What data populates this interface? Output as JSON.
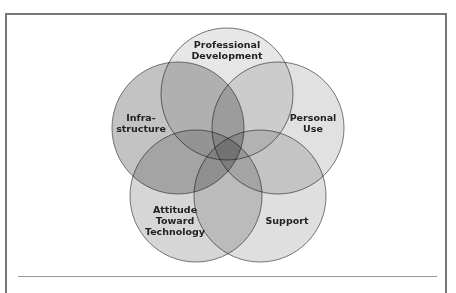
{
  "diagram": {
    "type": "venn",
    "sets": [
      {
        "id": "professional-development",
        "label_lines": [
          "Professional",
          "Development"
        ],
        "fill": "#d9d9d9",
        "cx": 227,
        "cy": 94,
        "r": 66,
        "label_x": 227,
        "label_y": 48
      },
      {
        "id": "personal-use",
        "label_lines": [
          "Personal",
          "Use"
        ],
        "fill": "#cfcfcf",
        "cx": 278,
        "cy": 128,
        "r": 66,
        "label_x": 313,
        "label_y": 121
      },
      {
        "id": "support",
        "label_lines": [
          "Support"
        ],
        "fill": "#cccccc",
        "cx": 260,
        "cy": 196,
        "r": 66,
        "label_x": 287,
        "label_y": 224
      },
      {
        "id": "attitude-toward-technology",
        "label_lines": [
          "Attitude",
          "Toward",
          "Technology"
        ],
        "fill": "#bdbdbd",
        "cx": 196,
        "cy": 196,
        "r": 66,
        "label_x": 175,
        "label_y": 213
      },
      {
        "id": "infrastructure",
        "label_lines": [
          "Infra-",
          "structure"
        ],
        "fill": "#9e9e9e",
        "cx": 178,
        "cy": 128,
        "r": 66,
        "label_x": 141,
        "label_y": 121
      }
    ],
    "stroke": "#555555"
  }
}
